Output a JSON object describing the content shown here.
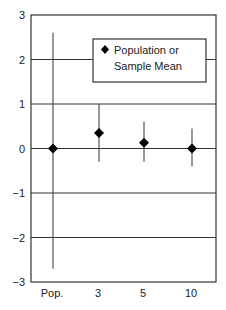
{
  "chart_data": {
    "type": "scatter",
    "subtype": "point-with-error-bars",
    "title": "",
    "xlabel": "",
    "ylabel": "",
    "categories": [
      "Pop.",
      "3",
      "5",
      "10"
    ],
    "series": [
      {
        "name": "Population or Sample Mean",
        "marker": "diamond",
        "values": [
          0.0,
          0.35,
          0.13,
          0.0
        ],
        "error_upper": [
          2.6,
          1.0,
          0.6,
          0.45
        ],
        "error_lower": [
          -2.7,
          -0.3,
          -0.3,
          -0.4
        ]
      }
    ],
    "ylim": [
      -3,
      3
    ],
    "yticks": [
      3,
      2,
      1,
      0,
      -1,
      -2,
      -3
    ],
    "ytick_labels": [
      "3",
      "2",
      "1",
      "0",
      "−1",
      "−2",
      "−3"
    ],
    "grid": {
      "horizontal": true,
      "vertical": false
    },
    "legend": {
      "position": "upper right inside",
      "entries": [
        "Population or Sample Mean"
      ]
    }
  },
  "legend": {
    "line1": "Population or",
    "line2": "Sample Mean"
  },
  "colors": {
    "axis": "#333333",
    "grid": "#333333",
    "marker": "#000000",
    "error_bar": "#444444"
  }
}
